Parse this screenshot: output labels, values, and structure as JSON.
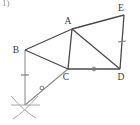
{
  "problem": {
    "number": "1)"
  },
  "figure": {
    "type": "geometry-construction-diagram",
    "stroke_color": "#4a4a4a",
    "construction_color": "#9a9a9a",
    "label_color": "#3a3a3a",
    "background": "#ffffff",
    "vertices": [
      {
        "name": "A",
        "x": 72,
        "y": 29,
        "label": "A",
        "label_x": 68,
        "label_y": 24
      },
      {
        "name": "B",
        "x": 25,
        "y": 50,
        "label": "B",
        "label_x": 14,
        "label_y": 52
      },
      {
        "name": "C",
        "x": 68,
        "y": 69,
        "label": "C",
        "label_x": 64,
        "label_y": 80
      },
      {
        "name": "D",
        "x": 120,
        "y": 69,
        "label": "D",
        "label_x": 119,
        "label_y": 80
      },
      {
        "name": "E",
        "x": 124,
        "y": 15,
        "label": "E",
        "label_x": 120,
        "label_y": 11
      },
      {
        "name": "P",
        "x": 25,
        "y": 105,
        "label": "",
        "label_x": 0,
        "label_y": 0
      }
    ],
    "segments": [
      {
        "name": "BA",
        "from": "B",
        "to": "A",
        "style": "solid"
      },
      {
        "name": "AE",
        "from": "A",
        "to": "E",
        "style": "solid"
      },
      {
        "name": "ED",
        "from": "E",
        "to": "D",
        "style": "solid"
      },
      {
        "name": "AD",
        "from": "A",
        "to": "D",
        "style": "solid"
      },
      {
        "name": "AC",
        "from": "A",
        "to": "C",
        "style": "solid"
      },
      {
        "name": "BC",
        "from": "B",
        "to": "C",
        "style": "solid"
      },
      {
        "name": "CD",
        "from": "C",
        "to": "D",
        "style": "solid"
      },
      {
        "name": "BP",
        "from": "B",
        "to": "P",
        "style": "construction"
      },
      {
        "name": "PC",
        "from": "P",
        "to": "C",
        "style": "construction"
      }
    ],
    "tick_marks": [
      {
        "name": "tick-on-BP",
        "segment": "BP",
        "x": 25,
        "y": 75,
        "kind": "single-dash"
      },
      {
        "name": "tick-on-PC",
        "segment": "PC",
        "x": 42,
        "y": 88,
        "kind": "small-circle"
      },
      {
        "name": "tick-on-CD",
        "segment": "CD",
        "x": 94,
        "y": 69,
        "kind": "small-circle"
      },
      {
        "name": "tick-on-ED",
        "segment": "ED",
        "x": 122,
        "y": 42,
        "kind": "single-dash"
      }
    ],
    "compass_arcs": {
      "name": "compass-arc-crossing",
      "center_x": 25,
      "center_y": 105,
      "description": "crossing construction arcs at point P"
    }
  }
}
